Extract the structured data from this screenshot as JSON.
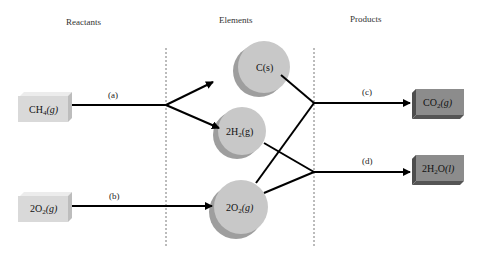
{
  "headings": {
    "reactants": "Reactants",
    "elements": "Elements",
    "products": "Products"
  },
  "reactants": [
    {
      "id": "ch4",
      "main": "CH",
      "sub": "4",
      "state": "(g)",
      "coeff": ""
    },
    {
      "id": "o2",
      "main": "2O",
      "sub": "2",
      "state": "(g)",
      "coeff": ""
    }
  ],
  "elements": [
    {
      "id": "c",
      "text": "C(s)"
    },
    {
      "id": "h2",
      "main": "2H",
      "sub": "2",
      "state": "(g)"
    },
    {
      "id": "o2e",
      "main": "2O",
      "sub": "2",
      "state": "(g)"
    }
  ],
  "products": [
    {
      "id": "co2",
      "main": "CO",
      "sub": "2",
      "state": "(g)"
    },
    {
      "id": "h2o",
      "main": "2H",
      "sub": "2",
      "after": "O",
      "state": "(l)"
    }
  ],
  "steps": {
    "a": "(a)",
    "b": "(b)",
    "c": "(c)",
    "d": "(d)"
  },
  "colors": {
    "reactant_box": "#d9d9d9",
    "reactant_box_side": "#bdbdbd",
    "element_circle": "#c8c8c8",
    "element_circle_side": "#9e9e9e",
    "product_box": "#8c8c8c",
    "product_box_side": "#4d4d4d",
    "line": "#000000",
    "divider": "#555555"
  }
}
